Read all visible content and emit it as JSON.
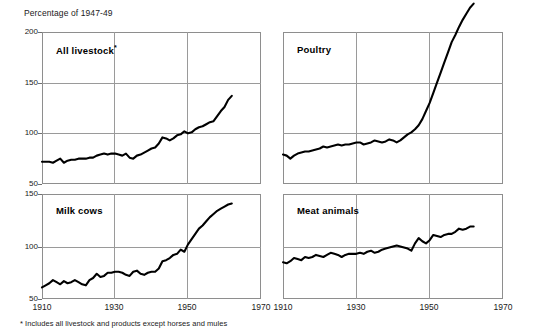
{
  "axis_title": "Percentage of 1947-49",
  "footnote": "* Includes all livestock and products except horses and mules",
  "panels": {
    "all_livestock": {
      "label": "All livestock",
      "footnote_marker": "*"
    },
    "poultry": {
      "label": "Poultry"
    },
    "milk_cows": {
      "label": "Milk cows"
    },
    "meat_animals": {
      "label": "Meat animals"
    }
  },
  "ticks": {
    "y_top": [
      "200",
      "150",
      "100",
      "50"
    ],
    "y_bottom": [
      "150",
      "100",
      "50"
    ],
    "x": [
      "1910",
      "1930",
      "1950",
      "1970"
    ]
  },
  "colors": {
    "line": "#000000",
    "grid": "#9a9a9a",
    "frame": "#8e8e8e",
    "text": "#1a1a1a",
    "background": "#ffffff"
  },
  "chart_data": {
    "type": "line",
    "subtitle": "Percentage of 1947-49",
    "xlabel": "",
    "ylabel": "Percentage of 1947-49",
    "grid": true,
    "legend_position": "none",
    "annotations": [
      "* Includes all livestock and products except horses and mules"
    ],
    "panels": [
      {
        "name": "All livestock",
        "position": "top-left",
        "footnote_marker": "*",
        "xlim": [
          1910,
          1970
        ],
        "ylim": [
          50,
          200
        ],
        "xticks": [
          1910,
          1930,
          1950,
          1970
        ],
        "yticks": [
          50,
          100,
          150,
          200
        ],
        "x": [
          1910,
          1911,
          1912,
          1913,
          1914,
          1915,
          1916,
          1917,
          1918,
          1919,
          1920,
          1921,
          1922,
          1923,
          1924,
          1925,
          1926,
          1927,
          1928,
          1929,
          1930,
          1931,
          1932,
          1933,
          1934,
          1935,
          1936,
          1937,
          1938,
          1939,
          1940,
          1941,
          1942,
          1943,
          1944,
          1945,
          1946,
          1947,
          1948,
          1949,
          1950,
          1951,
          1952,
          1953,
          1954,
          1955,
          1956,
          1957,
          1958,
          1959,
          1960,
          1961,
          1962
        ],
        "values": [
          72,
          72,
          72,
          71,
          73,
          75,
          71,
          73,
          74,
          74,
          75,
          75,
          75,
          76,
          76,
          78,
          79,
          80,
          79,
          80,
          80,
          79,
          78,
          80,
          76,
          75,
          78,
          79,
          81,
          83,
          85,
          86,
          90,
          96,
          95,
          93,
          95,
          98,
          99,
          102,
          100,
          101,
          104,
          106,
          107,
          109,
          111,
          112,
          117,
          122,
          126,
          133,
          137,
          145
        ]
      },
      {
        "name": "Poultry",
        "position": "top-right",
        "xlim": [
          1910,
          1970
        ],
        "ylim": [
          50,
          200
        ],
        "xticks": [
          1910,
          1930,
          1950,
          1970
        ],
        "yticks": [
          50,
          100,
          150,
          200
        ],
        "x": [
          1910,
          1911,
          1912,
          1913,
          1914,
          1915,
          1916,
          1917,
          1918,
          1919,
          1920,
          1921,
          1922,
          1923,
          1924,
          1925,
          1926,
          1927,
          1928,
          1929,
          1930,
          1931,
          1932,
          1933,
          1934,
          1935,
          1936,
          1937,
          1938,
          1939,
          1940,
          1941,
          1942,
          1943,
          1944,
          1945,
          1946,
          1947,
          1948,
          1949,
          1950,
          1951,
          1952,
          1953,
          1954,
          1955,
          1956,
          1957,
          1958,
          1959,
          1960,
          1961,
          1962
        ],
        "values": [
          79,
          78,
          75,
          78,
          80,
          81,
          82,
          82,
          83,
          84,
          85,
          87,
          86,
          87,
          88,
          89,
          88,
          89,
          89,
          90,
          91,
          91,
          89,
          90,
          91,
          93,
          92,
          91,
          92,
          94,
          93,
          91,
          93,
          96,
          99,
          101,
          104,
          108,
          114,
          122,
          130,
          140,
          150,
          160,
          170,
          180,
          190,
          197,
          205,
          212,
          218,
          224,
          228
        ],
        "note": "Series rises above the top of the panel frame after about 1958"
      },
      {
        "name": "Milk cows",
        "position": "bottom-left",
        "xlim": [
          1910,
          1970
        ],
        "ylim": [
          50,
          150
        ],
        "xticks": [
          1910,
          1930,
          1950,
          1970
        ],
        "yticks": [
          50,
          100,
          150
        ],
        "x": [
          1910,
          1911,
          1912,
          1913,
          1914,
          1915,
          1916,
          1917,
          1918,
          1919,
          1920,
          1921,
          1922,
          1923,
          1924,
          1925,
          1926,
          1927,
          1928,
          1929,
          1930,
          1931,
          1932,
          1933,
          1934,
          1935,
          1936,
          1937,
          1938,
          1939,
          1940,
          1941,
          1942,
          1943,
          1944,
          1945,
          1946,
          1947,
          1948,
          1949,
          1950,
          1951,
          1952,
          1953,
          1954,
          1955,
          1956,
          1957,
          1958,
          1959,
          1960,
          1961,
          1962
        ],
        "values": [
          61,
          63,
          65,
          68,
          66,
          64,
          67,
          65,
          66,
          68,
          66,
          64,
          63,
          68,
          70,
          74,
          71,
          72,
          75,
          75,
          76,
          76,
          75,
          73,
          72,
          76,
          77,
          74,
          73,
          75,
          76,
          76,
          79,
          86,
          87,
          89,
          92,
          93,
          97,
          95,
          102,
          107,
          112,
          117,
          120,
          124,
          128,
          131,
          134,
          136,
          138,
          140,
          141
        ]
      },
      {
        "name": "Meat animals",
        "position": "bottom-right",
        "xlim": [
          1910,
          1970
        ],
        "ylim": [
          50,
          150
        ],
        "xticks": [
          1910,
          1930,
          1950,
          1970
        ],
        "yticks": [
          50,
          100,
          150
        ],
        "x": [
          1910,
          1911,
          1912,
          1913,
          1914,
          1915,
          1916,
          1917,
          1918,
          1919,
          1920,
          1921,
          1922,
          1923,
          1924,
          1925,
          1926,
          1927,
          1928,
          1929,
          1930,
          1931,
          1932,
          1933,
          1934,
          1935,
          1936,
          1937,
          1938,
          1939,
          1940,
          1941,
          1942,
          1943,
          1944,
          1945,
          1946,
          1947,
          1948,
          1949,
          1950,
          1951,
          1952,
          1953,
          1954,
          1955,
          1956,
          1957,
          1958,
          1959,
          1960,
          1961,
          1962
        ],
        "values": [
          85,
          84,
          86,
          89,
          88,
          87,
          90,
          89,
          90,
          92,
          91,
          90,
          92,
          94,
          93,
          92,
          90,
          92,
          93,
          93,
          93,
          94,
          93,
          95,
          96,
          94,
          95,
          97,
          98,
          99,
          100,
          101,
          100,
          99,
          98,
          96,
          103,
          108,
          105,
          103,
          106,
          111,
          110,
          109,
          111,
          112,
          112,
          114,
          117,
          116,
          117,
          119,
          119
        ]
      }
    ]
  }
}
